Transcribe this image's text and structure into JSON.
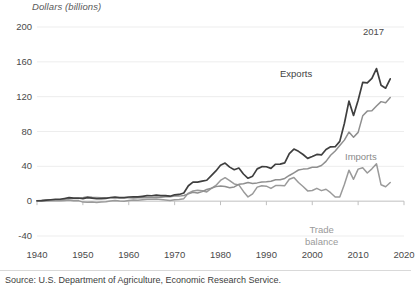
{
  "chart_data": {
    "type": "line",
    "title": "",
    "ylabel": "Dollars (billions)",
    "xlabel": "",
    "ylim": [
      -40,
      200
    ],
    "xlim": [
      1940,
      2020
    ],
    "yticks": [
      -40,
      0,
      40,
      80,
      120,
      160,
      200
    ],
    "xticks": [
      1940,
      1950,
      1960,
      1970,
      1980,
      1990,
      2000,
      2010,
      2020
    ],
    "grid": "horizontal",
    "legend_position": "inline-annotations",
    "annotations": [
      {
        "text": "2017",
        "x": 2017,
        "y": 188
      },
      {
        "text": "Exports",
        "x": 1993,
        "y": 142
      },
      {
        "text": "Imports",
        "x": 2012,
        "y": 58
      },
      {
        "text": "Trade balance",
        "x": 2006,
        "y": -22
      }
    ],
    "x": [
      1940,
      1941,
      1942,
      1943,
      1944,
      1945,
      1946,
      1947,
      1948,
      1949,
      1950,
      1951,
      1952,
      1953,
      1954,
      1955,
      1956,
      1957,
      1958,
      1959,
      1960,
      1961,
      1962,
      1963,
      1964,
      1965,
      1966,
      1967,
      1968,
      1969,
      1970,
      1971,
      1972,
      1973,
      1974,
      1975,
      1976,
      1977,
      1978,
      1979,
      1980,
      1981,
      1982,
      1983,
      1984,
      1985,
      1986,
      1987,
      1988,
      1989,
      1990,
      1991,
      1992,
      1993,
      1994,
      1995,
      1996,
      1997,
      1998,
      1999,
      2000,
      2001,
      2002,
      2003,
      2004,
      2005,
      2006,
      2007,
      2008,
      2009,
      2010,
      2011,
      2012,
      2013,
      2014,
      2015,
      2016,
      2017
    ],
    "series": [
      {
        "name": "Exports",
        "color": "#3f3f3f",
        "values": [
          0.5,
          0.7,
          1.1,
          1.6,
          2.2,
          2.2,
          3.1,
          4.0,
          3.5,
          3.6,
          2.9,
          4.0,
          3.4,
          2.8,
          3.0,
          3.1,
          4.2,
          4.7,
          4.0,
          4.0,
          4.8,
          5.0,
          5.0,
          5.6,
          6.3,
          6.2,
          6.9,
          6.4,
          6.3,
          5.7,
          7.3,
          7.7,
          9.4,
          17.7,
          21.9,
          21.9,
          23.0,
          24.0,
          29.4,
          34.7,
          41.2,
          43.8,
          39.1,
          36.1,
          38.0,
          31.2,
          26.3,
          28.7,
          37.1,
          39.6,
          39.5,
          37.6,
          42.4,
          42.6,
          43.9,
          54.7,
          59.8,
          57.2,
          53.6,
          49.1,
          51.2,
          53.7,
          53.1,
          59.4,
          62.4,
          62.5,
          68.7,
          89.2,
          114.9,
          98.5,
          115.8,
          136.4,
          135.8,
          140.9,
          152.3,
          133.1,
          129.7,
          140.5
        ]
      },
      {
        "name": "Imports",
        "color": "#8f8f8f",
        "values": [
          0.6,
          0.8,
          1.0,
          1.2,
          1.4,
          1.7,
          2.2,
          2.8,
          3.1,
          3.0,
          4.0,
          5.2,
          4.5,
          4.2,
          4.0,
          3.8,
          4.0,
          4.0,
          3.9,
          4.0,
          4.0,
          3.7,
          3.9,
          4.0,
          4.1,
          4.1,
          4.5,
          4.5,
          5.0,
          5.0,
          5.8,
          5.8,
          6.5,
          8.4,
          10.2,
          9.3,
          11.0,
          13.4,
          14.8,
          16.7,
          17.4,
          16.8,
          15.4,
          16.3,
          19.3,
          20.0,
          21.5,
          20.4,
          21.0,
          21.9,
          22.3,
          22.9,
          24.5,
          24.6,
          26.1,
          29.5,
          32.6,
          35.8,
          36.8,
          37.3,
          38.9,
          39.0,
          41.0,
          45.7,
          52.7,
          57.7,
          64.0,
          70.1,
          79.3,
          73.4,
          79.0,
          98.0,
          103.4,
          103.8,
          109.3,
          114.3,
          113.1,
          119.1
        ]
      },
      {
        "name": "Trade balance",
        "color": "#9a9a9a",
        "values": [
          -0.1,
          -0.1,
          0.1,
          0.4,
          0.8,
          0.5,
          0.9,
          1.2,
          0.4,
          0.6,
          -1.1,
          -1.2,
          -1.1,
          -1.4,
          -1.0,
          -0.7,
          0.2,
          0.7,
          0.1,
          0.0,
          0.8,
          1.3,
          1.1,
          1.6,
          2.2,
          2.1,
          2.4,
          1.9,
          1.3,
          0.7,
          1.5,
          1.9,
          2.9,
          9.3,
          11.7,
          12.6,
          12.0,
          10.6,
          14.6,
          18.0,
          23.8,
          27.0,
          23.7,
          19.8,
          18.7,
          11.2,
          4.8,
          8.3,
          16.1,
          17.7,
          17.2,
          14.7,
          17.9,
          18.0,
          17.8,
          25.2,
          27.2,
          21.4,
          16.8,
          11.8,
          12.3,
          14.7,
          12.1,
          13.7,
          9.7,
          4.8,
          4.7,
          19.1,
          35.6,
          25.1,
          36.8,
          38.4,
          32.4,
          37.1,
          43.0,
          18.8,
          16.6,
          21.4
        ]
      }
    ]
  },
  "footer": {
    "source": "Source: U.S. Department of Agriculture, Economic Research Service."
  }
}
